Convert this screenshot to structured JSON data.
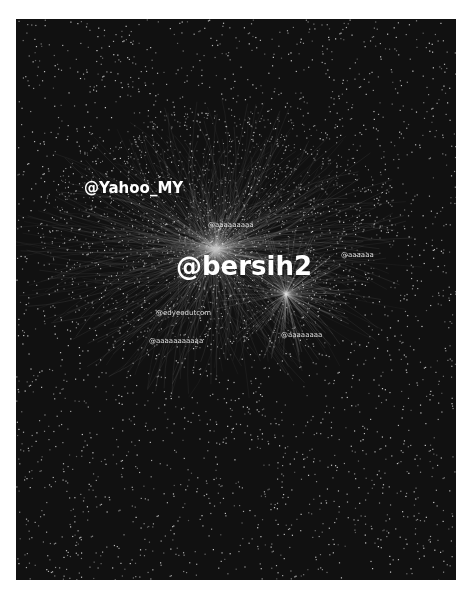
{
  "graph": {
    "background": "#111111",
    "node_color": "#d8d8d8",
    "edge_color": "#aaaaaa",
    "labels": [
      {
        "id": "yahoo",
        "text": "@Yahoo_MY",
        "x": 68,
        "y": 160,
        "size": "mid"
      },
      {
        "id": "bersih2",
        "text": "@bersih2",
        "x": 160,
        "y": 232,
        "size": "big"
      },
      {
        "id": "label-a",
        "text": "@aaaaaaaaa",
        "x": 192,
        "y": 202,
        "size": "sm"
      },
      {
        "id": "label-b",
        "text": "@edyeedutcom",
        "x": 140,
        "y": 290,
        "size": "sm"
      },
      {
        "id": "label-c",
        "text": "@aaaaaaaaaaa",
        "x": 133,
        "y": 318,
        "size": "sm"
      },
      {
        "id": "label-d",
        "text": "@aaaaaaaa",
        "x": 265,
        "y": 312,
        "size": "sm"
      },
      {
        "id": "label-e",
        "text": "@aaaaaa",
        "x": 325,
        "y": 232,
        "size": "sm"
      }
    ]
  }
}
